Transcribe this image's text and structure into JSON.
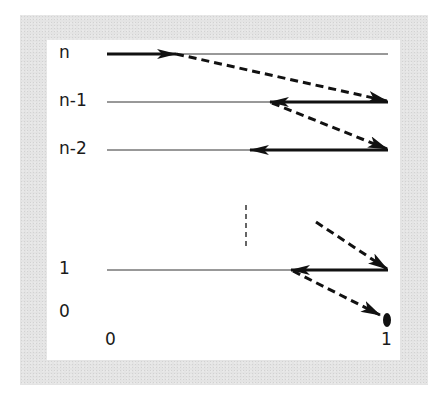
{
  "diagram": {
    "colors": {
      "frame": "#e4e4e4",
      "background": "#ffffff",
      "ink": "#111111"
    },
    "y_labels": [
      {
        "id": "n",
        "text": "n"
      },
      {
        "id": "n-1",
        "text": "n-1"
      },
      {
        "id": "n-2",
        "text": "n-2"
      },
      {
        "id": "1",
        "text": "1"
      },
      {
        "id": "0",
        "text": "0"
      }
    ],
    "x_labels": [
      {
        "id": "x0",
        "text": "0"
      },
      {
        "id": "x1",
        "text": "1"
      }
    ],
    "levels": [
      {
        "label": "n",
        "line": "thin horizontal from 0 to 1",
        "solid_arrow": "rightward from 0 to ~0.24"
      },
      {
        "label": "n-1",
        "line": "thin horizontal from 0 to 1",
        "solid_arrow": "leftward from 1 to ~0.58"
      },
      {
        "label": "n-2",
        "line": "thin horizontal from 0 to 1",
        "solid_arrow": "leftward from 1 to ~0.51"
      },
      {
        "label": "1",
        "line": "thin horizontal from 0 to 1",
        "solid_arrow": "leftward from 1 to ~0.66"
      },
      {
        "label": "0",
        "terminal": "filled dot at x=1"
      }
    ],
    "dashed_transitions": [
      "from level n (~0.24) to level n-1 at x=1",
      "from level n-1 (~0.58) to level n-2 at x=1",
      "from above (ellipsis) to level 1 at x=1",
      "from level 1 (~0.66) to level 0 dot at x=1"
    ],
    "ellipsis": "vertical dashed line between level n-2 and level 1"
  }
}
